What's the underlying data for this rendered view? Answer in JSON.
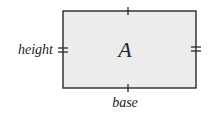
{
  "diagram": {
    "shape": "rectangle",
    "area_label": "A",
    "height_label": "height",
    "base_label": "base",
    "colors": {
      "fill": "#ececec",
      "stroke": "#2a2a2a",
      "text": "#222222"
    },
    "markings": {
      "top_bottom_ticks": "single",
      "left_right_ticks": "double"
    }
  }
}
